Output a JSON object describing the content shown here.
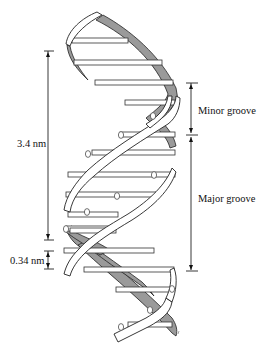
{
  "diagram": {
    "labels": {
      "helical_turn": "3.4 nm",
      "base_pair_spacing": "0.34 nm",
      "minor_groove": "Minor groove",
      "major_groove": "Major groove"
    },
    "colors": {
      "background": "#ffffff",
      "back_strand": "#9a9a9a",
      "front_strand": "#ffffff",
      "outline": "#222222"
    }
  }
}
